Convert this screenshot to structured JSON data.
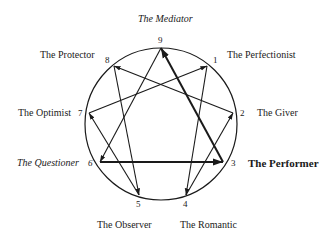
{
  "points": [
    {
      "n": "1",
      "name": "The Perfectionist",
      "style": "normal"
    },
    {
      "n": "2",
      "name": "The Giver",
      "style": "normal"
    },
    {
      "n": "3",
      "name": "The Performer",
      "style": "bold"
    },
    {
      "n": "4",
      "name": "The Romantic",
      "style": "normal"
    },
    {
      "n": "5",
      "name": "The Observer",
      "style": "normal"
    },
    {
      "n": "6",
      "name": "The Questioner",
      "style": "italic"
    },
    {
      "n": "7",
      "name": "The Optimist",
      "style": "normal"
    },
    {
      "n": "8",
      "name": "The Protector",
      "style": "normal"
    },
    {
      "n": "9",
      "name": "The Mediator",
      "style": "italic"
    }
  ],
  "connections": [
    {
      "from": "2",
      "to": "8",
      "bold": false
    },
    {
      "from": "7",
      "to": "1",
      "bold": false
    },
    {
      "from": "3",
      "to": "9",
      "bold": true
    },
    {
      "from": "9",
      "to": "6",
      "bold": false
    },
    {
      "from": "8",
      "to": "5",
      "bold": false
    },
    {
      "from": "1",
      "to": "4",
      "bold": false
    },
    {
      "from": "5",
      "to": "7",
      "bold": false
    },
    {
      "from": "4",
      "to": "2",
      "bold": false
    },
    {
      "from": "6",
      "to": "3",
      "bold": true
    }
  ],
  "colors": {
    "line": "#1a1a1a",
    "background": "#ffffff"
  }
}
